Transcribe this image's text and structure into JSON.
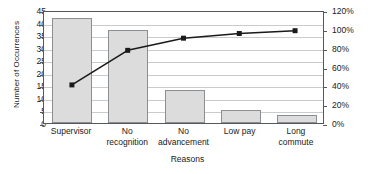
{
  "chart_data": {
    "type": "bar",
    "title": "",
    "xlabel": "Reasons",
    "ylabel": "Number of Occurrences",
    "y2label": "",
    "categories": [
      "Supervisor",
      "No recognition",
      "No advancement",
      "Low pay",
      "Long commute"
    ],
    "categories_wrapped": [
      [
        "Supervisor"
      ],
      [
        "No",
        "recognition"
      ],
      [
        "No",
        "advancement"
      ],
      [
        "Low pay"
      ],
      [
        "Long",
        "commute"
      ]
    ],
    "values": [
      42,
      37,
      13,
      5,
      3
    ],
    "ylim": [
      0,
      45
    ],
    "yticks": [
      0,
      5,
      10,
      15,
      20,
      25,
      30,
      35,
      40,
      45
    ],
    "ytick_labels": [
      "0",
      "5",
      "10",
      "15",
      "20",
      "25",
      "30",
      "35",
      "40",
      "45"
    ],
    "y2lim": [
      0,
      120
    ],
    "y2ticks": [
      0,
      20,
      40,
      60,
      80,
      100,
      120
    ],
    "y2tick_labels": [
      "0%",
      "20%",
      "40%",
      "60%",
      "80%",
      "100%",
      "120%"
    ],
    "grid": true,
    "legend": "none",
    "series": [
      {
        "name": "Number of Occurrences",
        "kind": "bar",
        "axis": "left",
        "values": [
          42,
          37,
          13,
          5,
          3
        ],
        "bar_fill": "#dcdcdc",
        "bar_border": "#8b8f91"
      },
      {
        "name": "Cumulative Percentage",
        "kind": "line",
        "axis": "right",
        "values": [
          42,
          79,
          92,
          97,
          100
        ],
        "line_color": "#1a1a1a",
        "marker": "square"
      }
    ]
  },
  "colors": {
    "background": "#ffffff",
    "axis": "#55595c",
    "gridline": "#c9ccce",
    "text": "#1a1a1a",
    "bar_fill": "#dcdcdc",
    "bar_border": "#8b8f91",
    "line": "#1a1a1a"
  }
}
